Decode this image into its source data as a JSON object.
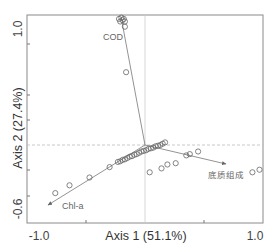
{
  "chart_data": {
    "type": "scatter",
    "subtype": "ordination-biplot",
    "title": "",
    "xlabel": "Axis 1 (51.1%)",
    "ylabel": "Axis 2 (27.4%)",
    "xlim": [
      -1.0,
      1.0
    ],
    "ylim": [
      -0.6,
      1.0
    ],
    "x_tick_labels": [
      "-1.0",
      "1.0"
    ],
    "y_tick_labels": [
      "-0.6",
      "1.0"
    ],
    "grid": false,
    "zero_lines": true,
    "legend": null,
    "vectors": [
      {
        "label": "COD",
        "x": -0.21,
        "y": 0.96
      },
      {
        "label": "Chl-a",
        "x": -0.83,
        "y": -0.52
      },
      {
        "label": "底质组成",
        "x": 0.64,
        "y": -0.16
      }
    ],
    "points": [
      {
        "x": -0.22,
        "y": 0.97
      },
      {
        "x": -0.2,
        "y": 0.98
      },
      {
        "x": -0.19,
        "y": 0.96
      },
      {
        "x": -0.18,
        "y": 0.97
      },
      {
        "x": -0.17,
        "y": 0.95
      },
      {
        "x": -0.21,
        "y": 0.95
      },
      {
        "x": -0.17,
        "y": 0.91
      },
      {
        "x": -0.16,
        "y": 0.56
      },
      {
        "x": -0.76,
        "y": -0.37
      },
      {
        "x": -0.64,
        "y": -0.31
      },
      {
        "x": -0.47,
        "y": -0.25
      },
      {
        "x": -0.3,
        "y": -0.17
      },
      {
        "x": -0.23,
        "y": -0.13
      },
      {
        "x": -0.21,
        "y": -0.125
      },
      {
        "x": -0.19,
        "y": -0.115
      },
      {
        "x": -0.17,
        "y": -0.11
      },
      {
        "x": -0.15,
        "y": -0.1
      },
      {
        "x": -0.13,
        "y": -0.09
      },
      {
        "x": -0.11,
        "y": -0.085
      },
      {
        "x": -0.09,
        "y": -0.075
      },
      {
        "x": -0.07,
        "y": -0.07
      },
      {
        "x": -0.05,
        "y": -0.06
      },
      {
        "x": -0.03,
        "y": -0.05
      },
      {
        "x": -0.01,
        "y": -0.045
      },
      {
        "x": 0.01,
        "y": -0.04
      },
      {
        "x": 0.03,
        "y": -0.03
      },
      {
        "x": 0.05,
        "y": -0.025
      },
      {
        "x": 0.07,
        "y": -0.02
      },
      {
        "x": 0.09,
        "y": -0.01
      },
      {
        "x": 0.11,
        "y": -0.005
      },
      {
        "x": 0.13,
        "y": 0.0
      },
      {
        "x": 0.15,
        "y": 0.01
      },
      {
        "x": 0.17,
        "y": 0.02
      },
      {
        "x": 0.04,
        "y": -0.21
      },
      {
        "x": 0.14,
        "y": -0.18
      },
      {
        "x": 0.19,
        "y": -0.15
      },
      {
        "x": 0.26,
        "y": -0.14
      },
      {
        "x": 0.35,
        "y": -0.08
      },
      {
        "x": 0.38,
        "y": -0.07
      },
      {
        "x": 0.45,
        "y": -0.05
      },
      {
        "x": 0.91,
        "y": -0.21
      },
      {
        "x": 0.97,
        "y": -0.19
      }
    ]
  },
  "axes": {
    "x_title": "Axis 1 (51.1%)",
    "y_title": "Axis 2 (27.4%)",
    "x_min_label": "-1.0",
    "x_max_label": "1.0",
    "y_min_label": "-0.6",
    "y_max_label": "1.0"
  },
  "vectors": {
    "cod_label": "COD",
    "chla_label": "Chl-a",
    "sediment_label": "底质组成"
  },
  "colors": {
    "frame": "#8a8a8a",
    "points": "#666666",
    "vectors": "#777777",
    "zero_line": "#bbbbbb"
  }
}
